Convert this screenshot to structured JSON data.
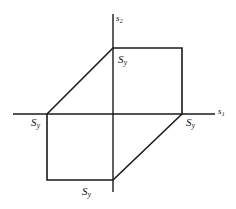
{
  "figure": {
    "background_color": "#ffffff",
    "line_color": "#1a1a1a",
    "axis_line_width": 1.4,
    "surface_line_width": 1.6
  },
  "axes": {
    "horizontal": {
      "label": "s",
      "subscript": "1",
      "x_start": 13,
      "x_end": 215,
      "y": 114
    },
    "vertical": {
      "label": "s",
      "subscript": "2",
      "y_start": 14,
      "y_end": 192,
      "x": 113
    },
    "origin": {
      "x": 113,
      "y": 114
    }
  },
  "labels": {
    "yield_stress_symbol": "S",
    "yield_stress_subscript": "y",
    "top": {
      "text": "S",
      "sub": "y"
    },
    "left": {
      "text": "S",
      "sub": "y"
    },
    "right": {
      "text": "S",
      "sub": "y"
    },
    "bottom": {
      "text": "S",
      "sub": "y"
    }
  },
  "chart_data": {
    "type": "line",
    "xlabel": "s1",
    "ylabel": "s2",
    "grid": false,
    "legend": null,
    "xlim": [
      -1.45,
      1.45
    ],
    "ylim": [
      -1.45,
      1.45
    ],
    "annotations": [
      {
        "text": "S_y",
        "at": [
          0.0,
          1.0
        ],
        "note": "top vertex on s2 axis"
      },
      {
        "text": "S_y",
        "at": [
          -1.0,
          0.0
        ],
        "note": "left vertex on s1 axis"
      },
      {
        "text": "S_y",
        "at": [
          1.0,
          0.0
        ],
        "note": "right vertex on s1 axis"
      },
      {
        "text": "S_y",
        "at": [
          0.0,
          -1.0
        ],
        "note": "bottom vertex on s2 axis"
      }
    ],
    "series": [
      {
        "name": "Tresca hexagon",
        "closed": true,
        "vertices_normalized": [
          [
            0.0,
            1.0
          ],
          [
            1.0,
            1.0
          ],
          [
            1.0,
            0.0
          ],
          [
            0.0,
            -1.0
          ],
          [
            -1.0,
            -1.0
          ],
          [
            -1.0,
            0.0
          ]
        ],
        "vertices_pixels": [
          [
            113,
            48
          ],
          [
            182,
            48
          ],
          [
            182,
            114
          ],
          [
            113,
            180
          ],
          [
            47,
            180
          ],
          [
            47,
            114
          ]
        ]
      }
    ]
  }
}
